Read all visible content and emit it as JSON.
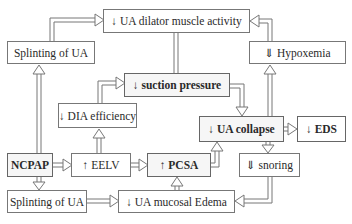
{
  "diagram": {
    "nodes": {
      "ua_dilator": {
        "label": "↓ UA dilator muscle activity"
      },
      "splinting_top": {
        "label": "Splinting of UA"
      },
      "hypoxemia": {
        "label": "⇓ Hypoxemia"
      },
      "suction_pressure": {
        "label": "↓ suction pressure"
      },
      "dia_efficiency": {
        "label": "↓ DIA efficiency"
      },
      "ua_collapse": {
        "label": "↓ UA collapse"
      },
      "eds": {
        "label": "↓ EDS"
      },
      "ncpap": {
        "label": "NCPAP"
      },
      "eelv": {
        "label": "↑ EELV"
      },
      "pcsa": {
        "label": "↑ PCSA"
      },
      "snoring": {
        "label": "⇓ snoring"
      },
      "splinting_bottom": {
        "label": "Splinting of UA"
      },
      "mucosal_edema": {
        "label": "↓ UA mucosal Edema"
      }
    },
    "edges": [
      {
        "from": "ncpap",
        "to": "splinting_top"
      },
      {
        "from": "ncpap",
        "to": "eelv"
      },
      {
        "from": "ncpap",
        "to": "splinting_bottom"
      },
      {
        "from": "splinting_top",
        "to": "ua_dilator"
      },
      {
        "from": "eelv",
        "to": "dia_efficiency"
      },
      {
        "from": "eelv",
        "to": "pcsa"
      },
      {
        "from": "dia_efficiency",
        "to": "suction_pressure"
      },
      {
        "from": "suction_pressure",
        "to": "ua_dilator"
      },
      {
        "from": "suction_pressure",
        "to": "ua_collapse"
      },
      {
        "from": "hypoxemia",
        "to": "ua_dilator"
      },
      {
        "from": "ua_collapse",
        "to": "hypoxemia"
      },
      {
        "from": "ua_collapse",
        "to": "eds"
      },
      {
        "from": "ua_collapse",
        "to": "snoring"
      },
      {
        "from": "pcsa",
        "to": "ua_collapse"
      },
      {
        "from": "snoring",
        "to": "mucosal_edema"
      },
      {
        "from": "mucosal_edema",
        "to": "pcsa"
      },
      {
        "from": "splinting_bottom",
        "to": "mucosal_edema"
      }
    ]
  }
}
